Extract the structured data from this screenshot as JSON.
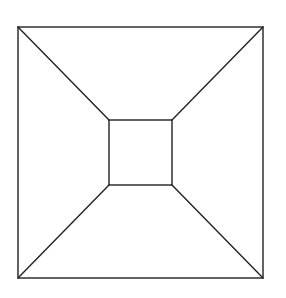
{
  "diagram": {
    "type": "square-frustum-top-view",
    "stroke_color": "#222222",
    "background": "#ffffff",
    "outer_square": {
      "x1": 18,
      "y1": 27,
      "x2": 263,
      "y2": 278
    },
    "inner_square": {
      "x1": 109,
      "y1": 120,
      "x2": 172,
      "y2": 185
    },
    "connectors": [
      {
        "name": "top-left",
        "from": [
          18,
          27
        ],
        "to": [
          109,
          120
        ]
      },
      {
        "name": "top-right",
        "from": [
          263,
          27
        ],
        "to": [
          172,
          120
        ]
      },
      {
        "name": "bottom-left",
        "from": [
          18,
          278
        ],
        "to": [
          109,
          185
        ]
      },
      {
        "name": "bottom-right",
        "from": [
          263,
          278
        ],
        "to": [
          172,
          185
        ]
      }
    ]
  }
}
